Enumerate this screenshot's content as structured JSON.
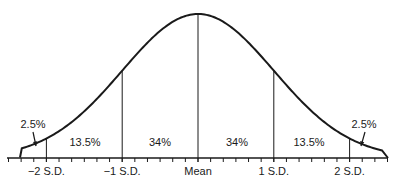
{
  "chart_data": {
    "type": "line",
    "title": "",
    "xlabel": "",
    "ylabel": "",
    "distribution": "normal",
    "xlim": [
      -2.5,
      2.5
    ],
    "sd_lines": [
      -2,
      -1,
      0,
      1,
      2
    ],
    "minor_ticks_per_sd": 6,
    "tick_labels": [
      {
        "x": -2,
        "label": "−2 S.D."
      },
      {
        "x": -1,
        "label": "−1 S.D."
      },
      {
        "x": 0,
        "label": "Mean"
      },
      {
        "x": 1,
        "label": "1 S.D."
      },
      {
        "x": 2,
        "label": "2 S.D."
      }
    ],
    "regions": [
      {
        "from": -2.5,
        "to": -2,
        "label": "2.5%",
        "value": 2.5
      },
      {
        "from": -2,
        "to": -1,
        "label": "13.5%",
        "value": 13.5
      },
      {
        "from": -1,
        "to": 0,
        "label": "34%",
        "value": 34
      },
      {
        "from": 0,
        "to": 1,
        "label": "34%",
        "value": 34
      },
      {
        "from": 1,
        "to": 2,
        "label": "13.5%",
        "value": 13.5
      },
      {
        "from": 2,
        "to": 2.5,
        "label": "2.5%",
        "value": 2.5
      }
    ],
    "grid": false,
    "legend": "none",
    "colors": {
      "line": "#1a1a1a",
      "background": "#ffffff"
    }
  }
}
